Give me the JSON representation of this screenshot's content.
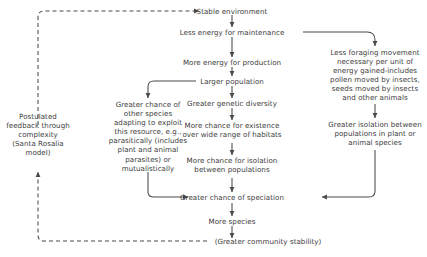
{
  "diagram": {
    "colors": {
      "text": "#3c3c3c",
      "line": "#4a4a4a",
      "background": "#ffffff"
    },
    "nodes": [
      {
        "id": "stable_environment",
        "label": "Stable environment"
      },
      {
        "id": "less_energy_maintenance",
        "label": "Less energy for maintenance"
      },
      {
        "id": "more_energy_production",
        "label": "More energy for production"
      },
      {
        "id": "larger_population",
        "label": "Larger population"
      },
      {
        "id": "greater_genetic_diversity",
        "label": "Greater genetic diversity"
      },
      {
        "id": "more_chance_existence",
        "label": "More chance for existence\nover wide range of habitats"
      },
      {
        "id": "more_chance_isolation",
        "label": "More chance for isolation\nbetween populations"
      },
      {
        "id": "greater_chance_speciation",
        "label": "Greater chance of speciation"
      },
      {
        "id": "more_species",
        "label": "More species"
      },
      {
        "id": "greater_community_stability",
        "label": "(Greater community stability)"
      },
      {
        "id": "postulated_feedback",
        "label": "Postulated\nfeedback through\ncomplexity\n(Santa Rosalia\nmodel)"
      },
      {
        "id": "greater_chance_other_species",
        "label": "Greater chance of\nother species\nadapting to exploit\nthis resource, e.g.,\nparasitically (includes\nplant and animal\nparasites) or\nmutualistically"
      },
      {
        "id": "less_foraging_movement",
        "label": "Less foraging movement\nnecessary per unit of\nenergy gained-includes\npollen moved by insects,\nseeds moved by insects\nand other animals"
      },
      {
        "id": "greater_isolation_populations",
        "label": "Greater isolation between\npopulations in plant or\nanimal species"
      }
    ],
    "edges": [
      {
        "from": "stable_environment",
        "to": "less_energy_maintenance",
        "style": "solid"
      },
      {
        "from": "less_energy_maintenance",
        "to": "more_energy_production",
        "style": "solid"
      },
      {
        "from": "more_energy_production",
        "to": "larger_population",
        "style": "solid"
      },
      {
        "from": "larger_population",
        "to": "greater_genetic_diversity",
        "style": "solid"
      },
      {
        "from": "larger_population",
        "to": "greater_chance_other_species",
        "style": "solid"
      },
      {
        "from": "greater_genetic_diversity",
        "to": "more_chance_existence",
        "style": "solid"
      },
      {
        "from": "more_chance_existence",
        "to": "more_chance_isolation",
        "style": "solid"
      },
      {
        "from": "more_chance_isolation",
        "to": "greater_chance_speciation",
        "style": "solid"
      },
      {
        "from": "greater_chance_other_species",
        "to": "greater_chance_speciation",
        "style": "solid"
      },
      {
        "from": "less_energy_maintenance",
        "to": "less_foraging_movement",
        "style": "solid"
      },
      {
        "from": "less_foraging_movement",
        "to": "greater_isolation_populations",
        "style": "solid"
      },
      {
        "from": "greater_isolation_populations",
        "to": "greater_chance_speciation",
        "style": "solid"
      },
      {
        "from": "greater_chance_speciation",
        "to": "more_species",
        "style": "solid"
      },
      {
        "from": "more_species",
        "to": "greater_community_stability",
        "style": "solid"
      },
      {
        "from": "greater_community_stability",
        "to": "postulated_feedback",
        "style": "dashed"
      },
      {
        "from": "postulated_feedback",
        "to": "stable_environment",
        "style": "dashed"
      }
    ]
  }
}
